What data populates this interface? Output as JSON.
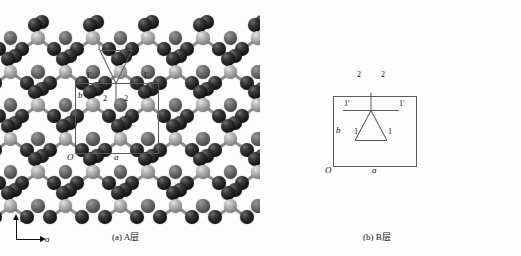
{
  "figure": {
    "title": "",
    "background": "#fdfdfd",
    "width": 521,
    "height": 256
  },
  "axis_key": {
    "name": "axis-key",
    "vertical_label": "b",
    "horizontal_label": "a"
  },
  "panels": [
    {
      "id": "a",
      "caption": "(a) A层",
      "origin_label": "O",
      "a_label": "a",
      "b_label": "b",
      "motif_orientation": "up",
      "site_labels": [
        {
          "text": "1",
          "x": 97,
          "y": 44
        },
        {
          "text": "1",
          "x": 131,
          "y": 44
        },
        {
          "text": "1'",
          "x": 86,
          "y": 72
        },
        {
          "text": "1'",
          "x": 143,
          "y": 72
        },
        {
          "text": "2",
          "x": 103,
          "y": 95
        },
        {
          "text": "2",
          "x": 124,
          "y": 95
        }
      ],
      "cell": {
        "x": 75,
        "y": 83,
        "w": 82,
        "h": 69
      }
    },
    {
      "id": "b",
      "caption": "(b) B层",
      "origin_label": "O",
      "a_label": "a",
      "b_label": "b",
      "motif_orientation": "down",
      "site_labels": [
        {
          "text": "2",
          "x": 357,
          "y": 71
        },
        {
          "text": "2",
          "x": 381,
          "y": 71
        },
        {
          "text": "1'",
          "x": 344,
          "y": 100
        },
        {
          "text": "1'",
          "x": 399,
          "y": 100
        },
        {
          "text": "1",
          "x": 354,
          "y": 128
        },
        {
          "text": "1",
          "x": 388,
          "y": 128
        }
      ],
      "cell": {
        "x": 333,
        "y": 96,
        "w": 82,
        "h": 69
      }
    }
  ],
  "atom_types": {
    "dark": {
      "name": "dark-atom",
      "color": "#141414",
      "radius": 7
    },
    "light": {
      "name": "light-atom",
      "color": "#b0b0b0",
      "radius": 6.5
    },
    "mid": {
      "name": "mid-atom",
      "color": "#6a6a6a",
      "radius": 6.5
    }
  },
  "lattice": {
    "col_spacing": 55,
    "row_spacing": 67,
    "half_row": 33.5,
    "motif_rows_y": [
      38,
      105,
      172
    ],
    "sphere_rows_y": [
      72,
      139,
      206
    ],
    "panel_a_cols_x": [
      38,
      93,
      148,
      203,
      258
    ],
    "panel_b_cols_x": [
      296,
      351,
      406,
      461,
      516
    ]
  }
}
